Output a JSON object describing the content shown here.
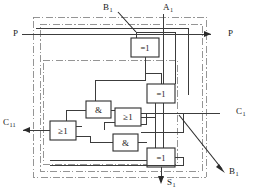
{
  "diagram": {
    "canvas": {
      "width": 257,
      "height": 196
    },
    "colors": {
      "background": "#ffffff",
      "wire": "#3c3c3c",
      "boundary": "#8a8a8a",
      "gate_stroke": "#2e2e2e",
      "gate_fill": "#ffffff",
      "text": "#1a1a1a",
      "arrow": "#2b2b2b"
    }
  },
  "ports": {
    "p_in": {
      "label": "P",
      "sub": "",
      "side": "left",
      "kind": "input"
    },
    "p_out": {
      "label": "P",
      "sub": "",
      "side": "right",
      "kind": "output"
    },
    "a1_in": {
      "label": "A",
      "sub": "1",
      "side": "top",
      "kind": "input"
    },
    "b1_in": {
      "label": "B",
      "sub": "1",
      "side": "top",
      "kind": "input"
    },
    "c1_in": {
      "label": "C",
      "sub": "1",
      "side": "right",
      "kind": "input"
    },
    "c11_out": {
      "label": "C",
      "sub": "11",
      "side": "left",
      "kind": "output"
    },
    "b1_ref": {
      "label": "B",
      "sub": "1",
      "side": "bottom-right",
      "kind": "annotation"
    },
    "s1_out": {
      "label": "S",
      "sub": "1",
      "side": "bottom",
      "kind": "output"
    }
  },
  "gates": [
    {
      "id": "xor1",
      "symbol": "=1",
      "type": "xor",
      "x": 131,
      "y": 38,
      "w": 28,
      "h": 19
    },
    {
      "id": "xor2",
      "symbol": "=1",
      "type": "xor",
      "x": 147,
      "y": 84,
      "w": 28,
      "h": 19
    },
    {
      "id": "and1",
      "symbol": "&",
      "type": "and",
      "x": 86,
      "y": 101,
      "w": 25,
      "h": 17
    },
    {
      "id": "or1",
      "symbol": "≥1",
      "type": "or",
      "x": 115,
      "y": 108,
      "w": 26,
      "h": 18
    },
    {
      "id": "or2",
      "symbol": "≥1",
      "type": "or",
      "x": 50,
      "y": 121,
      "w": 26,
      "h": 19
    },
    {
      "id": "and2",
      "symbol": "&",
      "type": "and",
      "x": 113,
      "y": 134,
      "w": 25,
      "h": 17
    },
    {
      "id": "xor3",
      "symbol": "=1",
      "type": "xor",
      "x": 147,
      "y": 148,
      "w": 28,
      "h": 19
    }
  ],
  "boundaries": [
    {
      "id": "outer-boundary",
      "x": 33,
      "y": 17,
      "w": 173,
      "h": 160
    },
    {
      "id": "middle-boundary",
      "x": 40,
      "y": 24,
      "w": 162,
      "h": 147
    },
    {
      "id": "inner-boundary",
      "x": 43,
      "y": 60,
      "w": 134,
      "h": 104
    }
  ],
  "annotations": {
    "b1_top_pointer": "leader line from B1 label down-right to node",
    "b1_bottom_pointer": "leader line with arrowhead pointing down-right to B1"
  },
  "icons": {
    "arrow_right": "arrow-right-icon",
    "arrow_left": "arrow-left-icon",
    "arrow_down": "arrow-down-icon",
    "arrow_diagonal": "arrow-diagonal-icon"
  }
}
